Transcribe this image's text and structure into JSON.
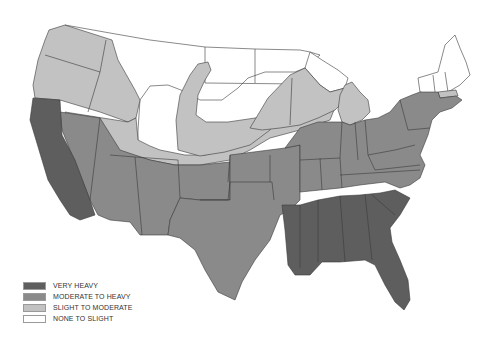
{
  "map": {
    "title": "",
    "subject": "United States regional shading map (grayscale)",
    "colors": {
      "very_heavy": "#5e5e5e",
      "moderate_to_heavy": "#8a8a8a",
      "slight_to_moderate": "#c2c2c2",
      "none_to_slight": "#ffffff",
      "border": "#3a3a3a"
    },
    "regions": {
      "very_heavy": [
        "California",
        "Louisiana",
        "Mississippi",
        "Alabama",
        "Georgia",
        "South Carolina",
        "Florida"
      ],
      "moderate_to_heavy": [
        "Nevada",
        "Arizona",
        "Utah (south)",
        "New Mexico",
        "Colorado (south)",
        "Texas",
        "Oklahoma",
        "Kansas",
        "Missouri",
        "Arkansas",
        "Iowa",
        "Illinois",
        "Indiana",
        "Ohio",
        "Kentucky",
        "Tennessee",
        "West Virginia",
        "Virginia",
        "North Carolina",
        "Pennsylvania",
        "New York",
        "New Jersey",
        "Maryland",
        "Delaware",
        "Connecticut",
        "Rhode Island",
        "Massachusetts",
        "Nebraska (south)"
      ],
      "slight_to_moderate": [
        "Washington",
        "Oregon",
        "Idaho",
        "Montana (west)",
        "Wyoming (west/south)",
        "Utah (north)",
        "Colorado (north)",
        "Nebraska (band)",
        "South Dakota (band)",
        "Minnesota (south)",
        "Wisconsin",
        "Michigan (lower)",
        "Massachusetts (north strip)"
      ],
      "none_to_slight": [
        "Montana (east)",
        "Wyoming (east)",
        "North Dakota",
        "South Dakota (north)",
        "Minnesota (north)",
        "Michigan (upper)",
        "Vermont",
        "New Hampshire",
        "Maine"
      ]
    }
  },
  "legend": {
    "items": [
      {
        "label": "VERY HEAVY",
        "color": "#5e5e5e"
      },
      {
        "label": "MODERATE TO HEAVY",
        "color": "#8a8a8a"
      },
      {
        "label": "SLIGHT TO MODERATE",
        "color": "#c2c2c2"
      },
      {
        "label": "NONE TO SLIGHT",
        "color": "#ffffff"
      }
    ]
  }
}
